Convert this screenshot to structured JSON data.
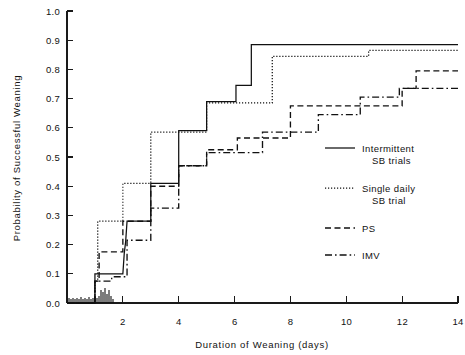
{
  "chart_data": {
    "type": "line",
    "title": "",
    "xlabel": "Duration of Weaning (days)",
    "ylabel": "Probability of Successful Weaning",
    "xlim": [
      0,
      14
    ],
    "ylim": [
      0.0,
      1.0
    ],
    "grid": false,
    "legend_position": "right-middle",
    "x_ticks": [
      2,
      4,
      6,
      8,
      10,
      12,
      14
    ],
    "x_tick_labels": [
      "2",
      "4",
      "6",
      "8",
      "10",
      "12",
      "14"
    ],
    "y_ticks": [
      0.0,
      0.1,
      0.2,
      0.3,
      0.4,
      0.5,
      0.6,
      0.7,
      0.8,
      0.9,
      1.0
    ],
    "y_tick_labels": [
      "0.0",
      "0.1",
      "0.2",
      "0.3",
      "0.4",
      "0.5",
      "0.6",
      "0.7",
      "0.8",
      "0.9",
      "1.0"
    ],
    "series": [
      {
        "name": "Intermittent SB trials",
        "style": "solid",
        "points": [
          [
            0.0,
            0.0
          ],
          [
            1.0,
            0.0
          ],
          [
            1.0,
            0.1
          ],
          [
            2.0,
            0.1
          ],
          [
            2.05,
            0.17
          ],
          [
            2.1,
            0.21
          ],
          [
            2.15,
            0.28
          ],
          [
            3.0,
            0.28
          ],
          [
            3.0,
            0.41
          ],
          [
            4.0,
            0.41
          ],
          [
            4.0,
            0.59
          ],
          [
            5.0,
            0.59
          ],
          [
            5.0,
            0.69
          ],
          [
            6.05,
            0.69
          ],
          [
            6.05,
            0.745
          ],
          [
            6.6,
            0.745
          ],
          [
            6.6,
            0.885
          ],
          [
            14.0,
            0.885
          ]
        ]
      },
      {
        "name": "Single daily SB trial",
        "style": "dotted",
        "points": [
          [
            0.0,
            0.0
          ],
          [
            1.0,
            0.0
          ],
          [
            1.0,
            0.075
          ],
          [
            1.1,
            0.075
          ],
          [
            1.1,
            0.28
          ],
          [
            2.0,
            0.28
          ],
          [
            2.0,
            0.41
          ],
          [
            3.0,
            0.41
          ],
          [
            3.0,
            0.585
          ],
          [
            5.0,
            0.585
          ],
          [
            5.0,
            0.685
          ],
          [
            7.35,
            0.685
          ],
          [
            7.35,
            0.845
          ],
          [
            10.8,
            0.845
          ],
          [
            10.8,
            0.865
          ],
          [
            14.0,
            0.865
          ]
        ]
      },
      {
        "name": "PS",
        "style": "dashed",
        "points": [
          [
            0.0,
            0.0
          ],
          [
            1.0,
            0.0
          ],
          [
            1.0,
            0.075
          ],
          [
            1.15,
            0.075
          ],
          [
            1.15,
            0.175
          ],
          [
            2.0,
            0.175
          ],
          [
            2.0,
            0.28
          ],
          [
            3.0,
            0.28
          ],
          [
            3.0,
            0.4
          ],
          [
            4.0,
            0.4
          ],
          [
            4.0,
            0.47
          ],
          [
            5.0,
            0.47
          ],
          [
            5.0,
            0.525
          ],
          [
            6.1,
            0.525
          ],
          [
            6.1,
            0.565
          ],
          [
            8.0,
            0.565
          ],
          [
            8.0,
            0.675
          ],
          [
            12.0,
            0.675
          ],
          [
            12.0,
            0.735
          ],
          [
            12.5,
            0.735
          ],
          [
            12.5,
            0.795
          ],
          [
            14.0,
            0.795
          ]
        ]
      },
      {
        "name": "IMV",
        "style": "dashdot",
        "points": [
          [
            0.0,
            0.0
          ],
          [
            1.0,
            0.0
          ],
          [
            1.0,
            0.075
          ],
          [
            1.6,
            0.075
          ],
          [
            1.6,
            0.09
          ],
          [
            2.15,
            0.09
          ],
          [
            2.15,
            0.215
          ],
          [
            3.0,
            0.215
          ],
          [
            3.0,
            0.325
          ],
          [
            4.0,
            0.325
          ],
          [
            4.0,
            0.47
          ],
          [
            5.0,
            0.47
          ],
          [
            5.0,
            0.515
          ],
          [
            7.0,
            0.515
          ],
          [
            7.0,
            0.585
          ],
          [
            9.0,
            0.585
          ],
          [
            9.0,
            0.645
          ],
          [
            10.5,
            0.645
          ],
          [
            10.5,
            0.705
          ],
          [
            11.9,
            0.705
          ],
          [
            11.9,
            0.735
          ],
          [
            14.0,
            0.735
          ]
        ]
      }
    ],
    "legend": [
      {
        "label_line1": "Intermittent",
        "label_line2": "SB trials",
        "style": "solid"
      },
      {
        "label_line1": "Single daily",
        "label_line2": "SB trial",
        "style": "dotted"
      },
      {
        "label_line1": "PS",
        "label_line2": "",
        "style": "dashed"
      },
      {
        "label_line1": "IMV",
        "label_line2": "",
        "style": "dashdot"
      }
    ],
    "censor_marks_note": "dense tick marks along baseline between day 0 and day 1",
    "colors": {
      "ink": "#111111",
      "background": "#ffffff"
    }
  }
}
